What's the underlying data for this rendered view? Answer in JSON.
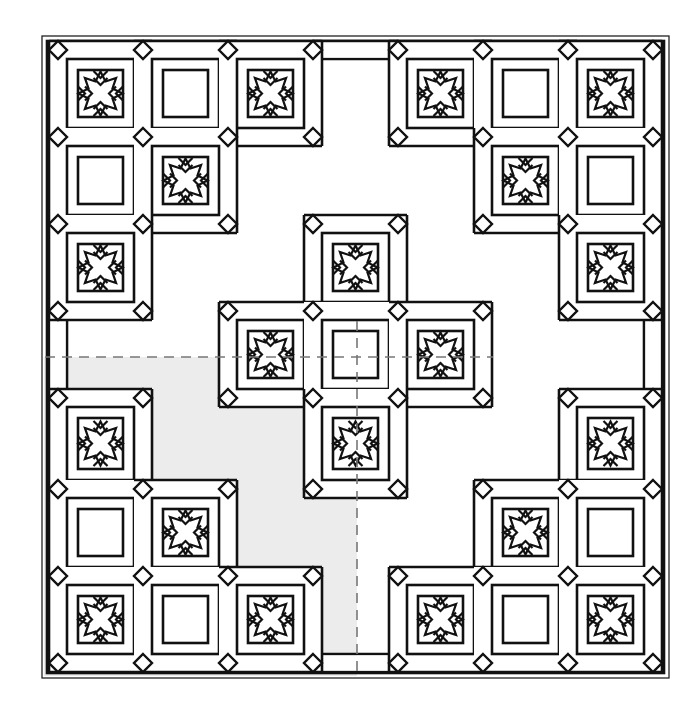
{
  "diagram": {
    "title": "",
    "type": "quilt-layout",
    "grid": {
      "rows": 7,
      "cols": 7,
      "x_lines": [
        58,
        143,
        228,
        313,
        398,
        483,
        568,
        653
      ],
      "y_lines": [
        50,
        137,
        224,
        311,
        398,
        489,
        576,
        663
      ]
    },
    "outer_border": {
      "x": 42,
      "y": 36,
      "width": 627,
      "height": 642
    },
    "quarter_marks": {
      "dashed_x": 357,
      "dashed_y": 357,
      "shaded_quadrant": "bottom-left"
    },
    "colors": {
      "line": "#111111",
      "shade": "#ececec",
      "dash": "#777777",
      "background": "#ffffff"
    },
    "blocks": [
      {
        "row": 0,
        "col": 0,
        "type": "star"
      },
      {
        "row": 0,
        "col": 1,
        "type": "plain"
      },
      {
        "row": 0,
        "col": 2,
        "type": "star"
      },
      {
        "row": 0,
        "col": 4,
        "type": "star"
      },
      {
        "row": 0,
        "col": 5,
        "type": "plain"
      },
      {
        "row": 0,
        "col": 6,
        "type": "star"
      },
      {
        "row": 1,
        "col": 0,
        "type": "plain"
      },
      {
        "row": 1,
        "col": 1,
        "type": "star"
      },
      {
        "row": 1,
        "col": 5,
        "type": "star"
      },
      {
        "row": 1,
        "col": 6,
        "type": "plain"
      },
      {
        "row": 2,
        "col": 0,
        "type": "star"
      },
      {
        "row": 2,
        "col": 3,
        "type": "star"
      },
      {
        "row": 2,
        "col": 6,
        "type": "star"
      },
      {
        "row": 3,
        "col": 2,
        "type": "star"
      },
      {
        "row": 3,
        "col": 3,
        "type": "plain"
      },
      {
        "row": 3,
        "col": 4,
        "type": "star"
      },
      {
        "row": 4,
        "col": 0,
        "type": "star"
      },
      {
        "row": 4,
        "col": 3,
        "type": "star"
      },
      {
        "row": 4,
        "col": 6,
        "type": "star"
      },
      {
        "row": 5,
        "col": 0,
        "type": "plain"
      },
      {
        "row": 5,
        "col": 1,
        "type": "star"
      },
      {
        "row": 5,
        "col": 5,
        "type": "star"
      },
      {
        "row": 5,
        "col": 6,
        "type": "plain"
      },
      {
        "row": 6,
        "col": 0,
        "type": "star"
      },
      {
        "row": 6,
        "col": 1,
        "type": "plain"
      },
      {
        "row": 6,
        "col": 2,
        "type": "star"
      },
      {
        "row": 6,
        "col": 4,
        "type": "star"
      },
      {
        "row": 6,
        "col": 5,
        "type": "plain"
      },
      {
        "row": 6,
        "col": 6,
        "type": "star"
      }
    ],
    "sashing_strips": [
      {
        "edge": "top",
        "col": 3
      },
      {
        "edge": "bottom",
        "col": 3
      },
      {
        "edge": "left",
        "row": 3
      },
      {
        "edge": "right",
        "row": 3
      }
    ],
    "counts": {
      "star_blocks": 17,
      "plain_blocks": 12
    }
  }
}
